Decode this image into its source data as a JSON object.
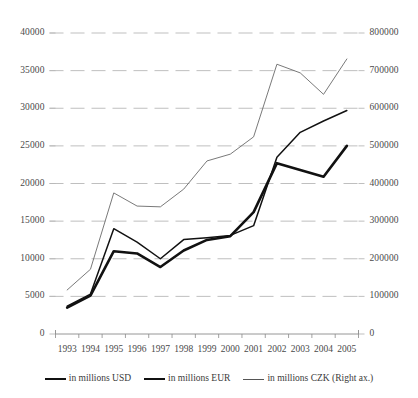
{
  "chart_data": {
    "type": "line",
    "title": "",
    "subtitle": "",
    "xlabel": "",
    "ylabel": "",
    "grid": true,
    "legend_position": "bottom",
    "categories": [
      "1993",
      "1994",
      "1995",
      "1996",
      "1997",
      "1998",
      "1999",
      "2000",
      "2001",
      "2002",
      "2003",
      "2004",
      "2005"
    ],
    "axes": {
      "left": {
        "label": "",
        "min": 0,
        "max": 40000,
        "step": 5000,
        "ticks": [
          "0",
          "5000",
          "10000",
          "15000",
          "20000",
          "25000",
          "30000",
          "35000",
          "40000"
        ]
      },
      "right": {
        "label": "",
        "min": 0,
        "max": 800000,
        "step": 100000,
        "ticks": [
          "0",
          "100000",
          "200000",
          "300000",
          "400000",
          "500000",
          "600000",
          "700000",
          "800000"
        ]
      }
    },
    "series": [
      {
        "name": "in millions USD",
        "axis": "left",
        "color": "#111111",
        "width": 1.5,
        "values": [
          3700,
          5300,
          14000,
          12200,
          10000,
          12550,
          12800,
          13100,
          14400,
          23500,
          26800,
          28300,
          29700
        ]
      },
      {
        "name": "in millions EUR",
        "axis": "left",
        "color": "#111111",
        "width": 2.6,
        "values": [
          3500,
          5100,
          11000,
          10700,
          8900,
          11100,
          12500,
          13000,
          16200,
          22700,
          21800,
          20900,
          25000
        ]
      },
      {
        "name": "in millions CZK (Right ax.)",
        "axis": "right",
        "color": "#6a6a6a",
        "width": 0.9,
        "values": [
          117000,
          172000,
          375000,
          340000,
          338000,
          385000,
          460000,
          478000,
          524000,
          717000,
          694000,
          637000,
          731000
        ]
      }
    ]
  },
  "legend": {
    "items": [
      {
        "label": "in millions USD",
        "swatch": "line-medium"
      },
      {
        "label": "in millions EUR",
        "swatch": "line-thick"
      },
      {
        "label": "in millions CZK (Right ax.)",
        "swatch": "line-thin"
      }
    ]
  },
  "colors": {
    "series_dark": "#111111",
    "series_gray": "#6a6a6a",
    "gridline": "#b8b8b8",
    "axis": "#8a8a8a",
    "text": "#3a3a3a",
    "background": "#ffffff"
  }
}
